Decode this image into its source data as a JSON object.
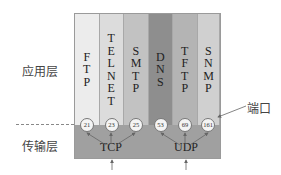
{
  "layers": {
    "application": "应用层",
    "transport": "传输层"
  },
  "protocols": [
    {
      "name": "FTP",
      "vertical": "F\nT\nP",
      "port": "21",
      "transport": "TCP",
      "color": "#ececec"
    },
    {
      "name": "TELNET",
      "vertical": "T\nE\nL\nN\nE\nT",
      "port": "23",
      "transport": "TCP",
      "color": "#dcdcdc"
    },
    {
      "name": "SMTP",
      "vertical": "S\nM\nT\nP",
      "port": "25",
      "transport": "TCP",
      "color": "#c2c2c2"
    },
    {
      "name": "DNS",
      "vertical": "D\nN\nS",
      "port": "53",
      "transport": "UDP",
      "color": "#8e8e8e"
    },
    {
      "name": "TFTP",
      "vertical": "T\nF\nT\nP",
      "port": "69",
      "transport": "UDP",
      "color": "#b4b4b4"
    },
    {
      "name": "SNMP",
      "vertical": "S\nN\nM\nP",
      "port": "161",
      "transport": "UDP",
      "color": "#d0d0d0"
    }
  ],
  "transport_protocols": [
    "TCP",
    "UDP"
  ],
  "annotation": {
    "port_label": "端口"
  }
}
